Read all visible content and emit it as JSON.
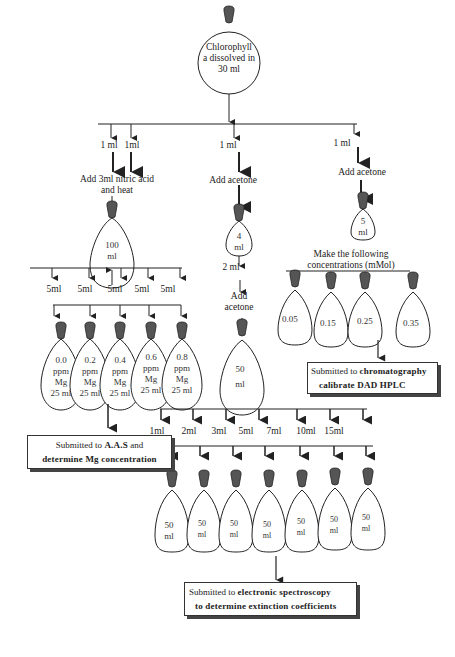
{
  "diagram": {
    "type": "flowchart",
    "source": {
      "label_lines": [
        "Chlorophyll",
        "a dissolved in",
        "30 ml"
      ]
    },
    "split_volumes": [
      "1 ml",
      "1ml",
      "1 ml",
      "1 ml"
    ],
    "branch_mg": {
      "step": [
        "Add 3ml nitric acid",
        "and heat"
      ],
      "flask_label": [
        "100",
        "ml"
      ],
      "aliquots": [
        "5ml",
        "5ml",
        "5ml",
        "5ml",
        "5ml"
      ],
      "standards": [
        {
          "lines": [
            "0.0",
            "ppm",
            "Mg",
            "25 ml"
          ]
        },
        {
          "lines": [
            "0.2",
            "ppm",
            "Mg",
            "25 ml"
          ]
        },
        {
          "lines": [
            "0.4",
            "ppm",
            "Mg",
            "25 ml"
          ]
        },
        {
          "lines": [
            "0.6",
            "ppm",
            "Mg",
            "25 ml"
          ]
        },
        {
          "lines": [
            "0.8",
            "ppm",
            "Mg",
            "25 ml"
          ]
        }
      ],
      "result_box": {
        "line1_prefix": "Submitted to ",
        "line1_bold": "A.A.S",
        "line1_suffix": " and",
        "line2_bold": "determine Mg concentration"
      }
    },
    "branch_extinction": {
      "step1": "Add acetone",
      "flask1_label": [
        "4",
        "ml"
      ],
      "transfer": "2 ml",
      "step2": [
        "Add",
        "acetone"
      ],
      "flask2_label": [
        "50",
        "ml"
      ],
      "aliquots": [
        "1ml",
        "2ml",
        "3ml",
        "5ml",
        "7ml",
        "10ml",
        "15ml"
      ],
      "flasks": [
        {
          "lines": [
            "50",
            "ml"
          ]
        },
        {
          "lines": [
            "50",
            "ml"
          ]
        },
        {
          "lines": [
            "50",
            "ml"
          ]
        },
        {
          "lines": [
            "50",
            "ml"
          ]
        },
        {
          "lines": [
            "50",
            "ml"
          ]
        },
        {
          "lines": [
            "50",
            "ml"
          ]
        },
        {
          "lines": [
            "50",
            "ml"
          ]
        }
      ],
      "result_box": {
        "line1_prefix": "Submitted to ",
        "line1_bold": "electronic spectroscopy",
        "line2_bold": "to determine extinction coefficients"
      }
    },
    "branch_hplc": {
      "step": "Add acetone",
      "flask_label": [
        "5",
        "ml"
      ],
      "concentrations_title": [
        "Make the following",
        "concentrations (mMol)"
      ],
      "concentrations": [
        "0.05",
        "0.15",
        "0.25",
        "0.35"
      ],
      "result_box": {
        "line1_prefix": "Submitted to ",
        "line1_bold": "chromatography",
        "line2_bold": "calibrate DAD HPLC"
      }
    },
    "colors": {
      "line": "#222222",
      "stopper": "#555555",
      "stopper_dark": "#333333",
      "flask_fill": "#ffffff",
      "box_shadow": "#444444"
    }
  }
}
